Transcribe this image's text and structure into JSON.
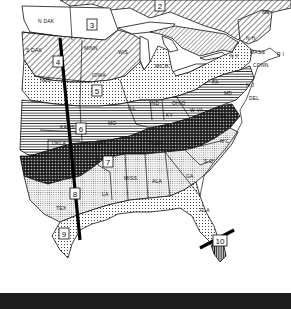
{
  "map": {
    "description": "Black-and-white map of the eastern United States divided into numbered climate/hardiness zones with hatched and stippled patterns",
    "zones": [
      {
        "number": "2",
        "x": 160,
        "y": 6
      },
      {
        "number": "3",
        "x": 92,
        "y": 24
      },
      {
        "number": "4",
        "x": 58,
        "y": 61
      },
      {
        "number": "5",
        "x": 97,
        "y": 90
      },
      {
        "number": "6",
        "x": 81,
        "y": 128
      },
      {
        "number": "7",
        "x": 108,
        "y": 161
      },
      {
        "number": "8",
        "x": 75,
        "y": 193
      },
      {
        "number": "9",
        "x": 64,
        "y": 233
      },
      {
        "number": "10",
        "x": 220,
        "y": 240
      }
    ],
    "state_labels": [
      {
        "id": "n-dak",
        "text": "N DAK",
        "x": 38,
        "y": 23
      },
      {
        "id": "s-dak",
        "text": "S DAK",
        "x": 28,
        "y": 52
      },
      {
        "id": "neb",
        "text": "NEB",
        "x": 44,
        "y": 82
      },
      {
        "id": "minn",
        "text": "MINN",
        "x": 84,
        "y": 50
      },
      {
        "id": "wis",
        "text": "WIS",
        "x": 118,
        "y": 54
      },
      {
        "id": "iowa",
        "text": "IOWA",
        "x": 93,
        "y": 77
      },
      {
        "id": "ill",
        "text": "ILL",
        "x": 128,
        "y": 110
      },
      {
        "id": "ind",
        "text": "IND",
        "x": 152,
        "y": 105
      },
      {
        "id": "ohio",
        "text": "OHIO",
        "x": 173,
        "y": 105
      },
      {
        "id": "mich",
        "text": "MICH",
        "x": 158,
        "y": 68
      },
      {
        "id": "pa",
        "text": "PA",
        "x": 212,
        "y": 84
      },
      {
        "id": "n-y",
        "text": "N Y",
        "x": 232,
        "y": 58
      },
      {
        "id": "n-h",
        "text": "N H",
        "x": 247,
        "y": 40
      },
      {
        "id": "me",
        "text": "ME",
        "x": 262,
        "y": 12
      },
      {
        "id": "mass",
        "text": "MASS",
        "x": 252,
        "y": 54
      },
      {
        "id": "r-i",
        "text": "R I",
        "x": 278,
        "y": 56
      },
      {
        "id": "conn",
        "text": "CONN",
        "x": 255,
        "y": 67
      },
      {
        "id": "n-j",
        "text": "N J",
        "x": 246,
        "y": 87
      },
      {
        "id": "del",
        "text": "DEL",
        "x": 249,
        "y": 100
      },
      {
        "id": "md",
        "text": "MD",
        "x": 225,
        "y": 95
      },
      {
        "id": "w-va",
        "text": "W VA",
        "x": 192,
        "y": 112
      },
      {
        "id": "va",
        "text": "VA",
        "x": 222,
        "y": 118
      },
      {
        "id": "ky",
        "text": "KY",
        "x": 168,
        "y": 117
      },
      {
        "id": "tenn",
        "text": "TENN",
        "x": 150,
        "y": 145
      },
      {
        "id": "n-c",
        "text": "N C",
        "x": 221,
        "y": 143
      },
      {
        "id": "s-c",
        "text": "S C",
        "x": 205,
        "y": 163
      },
      {
        "id": "ga",
        "text": "GA",
        "x": 189,
        "y": 178
      },
      {
        "id": "ala",
        "text": "ALA",
        "x": 155,
        "y": 183
      },
      {
        "id": "miss",
        "text": "MISS",
        "x": 127,
        "y": 180
      },
      {
        "id": "la",
        "text": "LA",
        "x": 103,
        "y": 196
      },
      {
        "id": "fla",
        "text": "FLA",
        "x": 202,
        "y": 212
      },
      {
        "id": "ark",
        "text": "ARK",
        "x": 98,
        "y": 144
      },
      {
        "id": "mo",
        "text": "MO",
        "x": 108,
        "y": 125
      },
      {
        "id": "kans",
        "text": "KANS",
        "x": 62,
        "y": 129
      },
      {
        "id": "okla",
        "text": "OKLA",
        "x": 55,
        "y": 145
      },
      {
        "id": "tex",
        "text": "TEX",
        "x": 60,
        "y": 210
      }
    ],
    "cut_lines": [
      {
        "id": "texas-cut-line",
        "x1": 60,
        "y1": 38,
        "x2": 80,
        "y2": 240
      },
      {
        "id": "florida-cut-line",
        "x1": 200,
        "y1": 240,
        "x2": 232,
        "y2": 225
      }
    ]
  },
  "footer": {
    "bar_color": "#1c1c1c"
  }
}
